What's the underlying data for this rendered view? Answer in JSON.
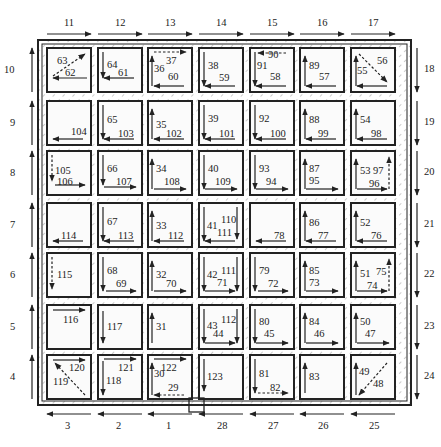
{
  "diagram": {
    "type": "cleaning-path / tool-path grid diagram",
    "grid": {
      "rows": 7,
      "cols": 7
    },
    "colors": {
      "line": "#222222",
      "hatch": "#9a9a9a",
      "background": "#ffffff",
      "cell_fill": "#fbfbfb"
    },
    "outer_path": {
      "top": [
        {
          "label": "11",
          "dir": "right"
        },
        {
          "label": "12",
          "dir": "right"
        },
        {
          "label": "13",
          "dir": "right"
        },
        {
          "label": "14",
          "dir": "right"
        },
        {
          "label": "15",
          "dir": "right"
        },
        {
          "label": "16",
          "dir": "right"
        },
        {
          "label": "17",
          "dir": "right"
        }
      ],
      "right": [
        {
          "label": "18",
          "dir": "down"
        },
        {
          "label": "19",
          "dir": "down"
        },
        {
          "label": "20",
          "dir": "down"
        },
        {
          "label": "21",
          "dir": "down"
        },
        {
          "label": "22",
          "dir": "down"
        },
        {
          "label": "23",
          "dir": "down"
        },
        {
          "label": "24",
          "dir": "down"
        }
      ],
      "bottom": [
        {
          "label": "3",
          "dir": "left"
        },
        {
          "label": "2",
          "dir": "left"
        },
        {
          "label": "1",
          "dir": "left"
        },
        {
          "label": "28",
          "dir": "left"
        },
        {
          "label": "27",
          "dir": "left"
        },
        {
          "label": "26",
          "dir": "left"
        },
        {
          "label": "25",
          "dir": "left"
        }
      ],
      "left": [
        {
          "label": "10",
          "dir": "up"
        },
        {
          "label": "9",
          "dir": "up"
        },
        {
          "label": "8",
          "dir": "up"
        },
        {
          "label": "7",
          "dir": "up"
        },
        {
          "label": "6",
          "dir": "up"
        },
        {
          "label": "5",
          "dir": "up"
        },
        {
          "label": "4",
          "dir": "up"
        }
      ]
    },
    "start_marker": {
      "label": "start-square",
      "position": "bottom between column 3 and 4"
    },
    "cells": [
      [
        {
          "labels": [
            "63",
            "62"
          ]
        },
        {
          "labels": [
            "64",
            "61"
          ]
        },
        {
          "labels": [
            "36",
            "37",
            "60"
          ]
        },
        {
          "labels": [
            "38",
            "59"
          ]
        },
        {
          "labels": [
            "91",
            "90",
            "58"
          ]
        },
        {
          "labels": [
            "89",
            "57"
          ]
        },
        {
          "labels": [
            "55",
            "56"
          ]
        }
      ],
      [
        {
          "labels": [
            "104"
          ]
        },
        {
          "labels": [
            "65",
            "103"
          ]
        },
        {
          "labels": [
            "35",
            "102"
          ]
        },
        {
          "labels": [
            "39",
            "101"
          ]
        },
        {
          "labels": [
            "92",
            "100"
          ]
        },
        {
          "labels": [
            "88",
            "99"
          ]
        },
        {
          "labels": [
            "54",
            "98"
          ]
        }
      ],
      [
        {
          "labels": [
            "105",
            "106"
          ]
        },
        {
          "labels": [
            "66",
            "107"
          ]
        },
        {
          "labels": [
            "34",
            "108"
          ]
        },
        {
          "labels": [
            "40",
            "109"
          ]
        },
        {
          "labels": [
            "93",
            "94"
          ]
        },
        {
          "labels": [
            "87",
            "95"
          ]
        },
        {
          "labels": [
            "53",
            "97",
            "96"
          ]
        }
      ],
      [
        {
          "labels": [
            "114"
          ]
        },
        {
          "labels": [
            "67",
            "113"
          ]
        },
        {
          "labels": [
            "33",
            "112"
          ]
        },
        {
          "labels": [
            "41",
            "110",
            "111"
          ]
        },
        {
          "labels": [
            "78"
          ]
        },
        {
          "labels": [
            "86",
            "77"
          ]
        },
        {
          "labels": [
            "52",
            "76"
          ]
        }
      ],
      [
        {
          "labels": [
            "115"
          ]
        },
        {
          "labels": [
            "68",
            "69"
          ]
        },
        {
          "labels": [
            "32",
            "70"
          ]
        },
        {
          "labels": [
            "42",
            "111",
            "71"
          ]
        },
        {
          "labels": [
            "79",
            "72"
          ]
        },
        {
          "labels": [
            "85",
            "73"
          ]
        },
        {
          "labels": [
            "51",
            "75",
            "74"
          ]
        }
      ],
      [
        {
          "labels": [
            "116"
          ]
        },
        {
          "labels": [
            "117"
          ]
        },
        {
          "labels": [
            "31"
          ]
        },
        {
          "labels": [
            "43",
            "112",
            "44"
          ]
        },
        {
          "labels": [
            "80",
            "45"
          ]
        },
        {
          "labels": [
            "84",
            "46"
          ]
        },
        {
          "labels": [
            "50",
            "47"
          ]
        }
      ],
      [
        {
          "labels": [
            "120",
            "119"
          ]
        },
        {
          "labels": [
            "121",
            "118"
          ]
        },
        {
          "labels": [
            "30",
            "122",
            "29"
          ]
        },
        {
          "labels": [
            "123"
          ]
        },
        {
          "labels": [
            "81",
            "82"
          ]
        },
        {
          "labels": [
            "83"
          ]
        },
        {
          "labels": [
            "49",
            "48"
          ]
        }
      ]
    ]
  }
}
